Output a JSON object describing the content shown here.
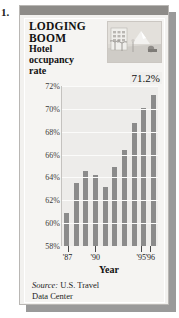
{
  "figure_number": "1.",
  "title": {
    "line1": "LODGING",
    "line2": "BOOM",
    "line3": "Hotel",
    "line4": "occupancy",
    "line5": "rate"
  },
  "photo": {
    "alt": "hotel-resort-illustration"
  },
  "source": {
    "prefix": "Source:",
    "text": "U.S. Travel",
    "text2": "Data Center"
  },
  "colors": {
    "bar": "#8b8b8b",
    "panel": "#f2f1ef",
    "plot": "#edecea",
    "topbar": "#8d8b88",
    "shadow": "#9a9a9a"
  },
  "chart_data": {
    "type": "bar",
    "xlabel": "Year",
    "ylabel": "",
    "ylim": [
      58,
      72
    ],
    "yticks": [
      58,
      60,
      62,
      64,
      66,
      68,
      70,
      72
    ],
    "ytick_labels": [
      "58%",
      "60%",
      "62%",
      "64%",
      "66%",
      "68%",
      "70%",
      "72%"
    ],
    "grid": true,
    "legend": false,
    "categories": [
      "1987",
      "1988",
      "1989",
      "1990",
      "1991",
      "1992",
      "1993",
      "1994",
      "1995",
      "1996"
    ],
    "xtick_labels": [
      "'87",
      "'90",
      "'95",
      "'96"
    ],
    "xtick_categories": [
      "1987",
      "1990",
      "1995",
      "1996"
    ],
    "values": [
      60.9,
      63.5,
      64.6,
      64.2,
      63.2,
      64.9,
      66.4,
      68.8,
      70.1,
      71.2
    ],
    "annotations": [
      {
        "label": "71.2%",
        "category": "1996",
        "value": 71.2
      }
    ]
  }
}
